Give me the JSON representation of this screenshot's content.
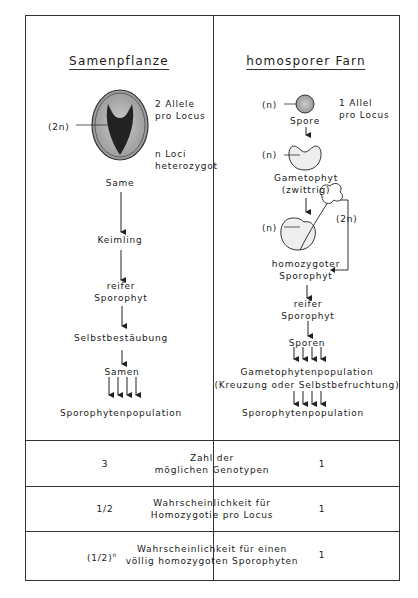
{
  "left": {
    "title": "Samenpflanze",
    "ploidy_label": "(2n)",
    "allele_note_1": "2 Allele",
    "allele_note_2": "pro Locus",
    "loci_note_1": "n Loci",
    "loci_note_2": "heterozygot",
    "steps": [
      "Same",
      "Keimling",
      "reifer",
      "Sporophyt",
      "Selbstbestäubung",
      "Samen",
      "Sporophytenpopulation"
    ]
  },
  "right": {
    "title": "homosporer Farn",
    "spore_ploidy": "(n)",
    "allele_note_1": "1 Allel",
    "allele_note_2": "pro Locus",
    "spore": "Spore",
    "gametophyte_ploidy": "(n)",
    "gametophyte_1": "Gametophyt",
    "gametophyte_2": "(zwittrig)",
    "sporophyte_gam_ploidy": "(n)",
    "sporophyte_ploidy": "(2n)",
    "homo_1": "homozygoter",
    "homo_2": "Sporophyt",
    "mature_1": "reifer",
    "mature_2": "Sporophyt",
    "spores": "Sporen",
    "gam_pop": "Gametophytenpopulation",
    "gam_pop_note": "(Kreuzung oder Selbstbefruchtung)",
    "spor_pop": "Sporophytenpopulation"
  },
  "table": [
    {
      "left": "3",
      "label_1": "Zahl der",
      "label_2": "möglichen Genotypen",
      "right": "1"
    },
    {
      "left": "1/2",
      "label_1": "Wahrscheinlichkeit für",
      "label_2": "Homozygotie pro Locus",
      "right": "1"
    },
    {
      "left": "(1/2)",
      "left_sup": "n",
      "label_1": "Wahrscheinlichkeit für einen",
      "label_2": "völlig homozygoten Sporophyten",
      "right": "1"
    }
  ]
}
